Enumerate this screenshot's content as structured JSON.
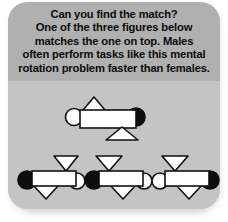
{
  "card": {
    "background_top": "#b0b0b0",
    "background_bottom": "#c4c4c4",
    "outer_background": "#ffffff"
  },
  "prompt": {
    "full_text": "Can you find the match? One of the three figures below matches the one on top. Males often perform tasks like this mental rotation problem faster than females.",
    "lines": [
      "Can you find the match?",
      "One of the three figures below",
      "matches the one on top. Males",
      "often perform tasks like this mental",
      "rotation problem faster than females."
    ],
    "text_color": "#0b0b0b"
  },
  "puzzle": {
    "type": "mental-rotation-match",
    "shape_colors": {
      "white_fill": "#ffffff",
      "black_fill": "#0d0d0d",
      "outline": "#111111"
    },
    "target": {
      "label": "target-figure",
      "position": "top",
      "parts": [
        {
          "part": "circle",
          "fill": "white",
          "side": "left"
        },
        {
          "part": "triangle",
          "direction": "up",
          "position": "above-left-of-bar"
        },
        {
          "part": "rectangle",
          "fill": "white",
          "position": "center"
        },
        {
          "part": "circle",
          "fill": "black",
          "side": "right"
        },
        {
          "part": "triangle",
          "direction": "up",
          "position": "below-right-of-bar"
        }
      ]
    },
    "options": [
      {
        "label": "option-1",
        "index": 1,
        "parts": [
          {
            "part": "circle",
            "fill": "black",
            "side": "left"
          },
          {
            "part": "triangle",
            "direction": "down",
            "position": "above-right-of-bar"
          },
          {
            "part": "rectangle",
            "fill": "white",
            "position": "center"
          },
          {
            "part": "circle",
            "fill": "white",
            "side": "right"
          },
          {
            "part": "triangle",
            "direction": "down",
            "position": "below-left-of-bar"
          }
        ]
      },
      {
        "label": "option-2",
        "index": 2,
        "parts": [
          {
            "part": "circle",
            "fill": "black",
            "side": "left"
          },
          {
            "part": "triangle",
            "direction": "down",
            "position": "above-left-of-bar"
          },
          {
            "part": "rectangle",
            "fill": "white",
            "position": "center"
          },
          {
            "part": "circle",
            "fill": "white",
            "side": "right"
          },
          {
            "part": "triangle",
            "direction": "down",
            "position": "below-center-of-bar"
          }
        ]
      },
      {
        "label": "option-3",
        "index": 3,
        "parts": [
          {
            "part": "circle",
            "fill": "white",
            "side": "left"
          },
          {
            "part": "triangle",
            "direction": "down",
            "position": "above-left-of-bar"
          },
          {
            "part": "rectangle",
            "fill": "white",
            "position": "center"
          },
          {
            "part": "circle",
            "fill": "black",
            "side": "right"
          },
          {
            "part": "triangle",
            "direction": "down",
            "position": "below-center-of-bar"
          }
        ]
      }
    ]
  }
}
